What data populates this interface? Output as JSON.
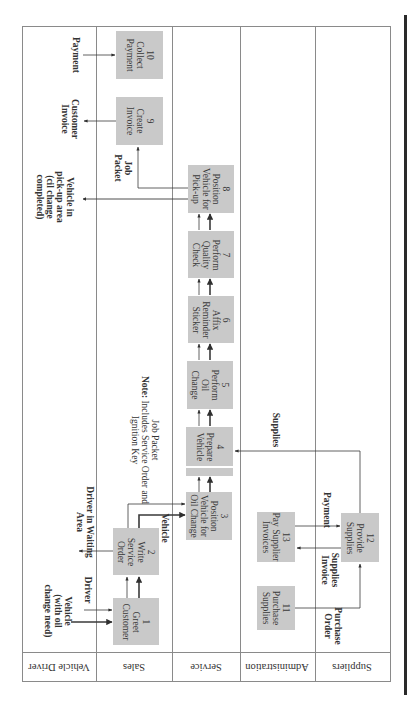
{
  "lanes": [
    {
      "id": "vehicle-driver",
      "label": "Vehicle Driver"
    },
    {
      "id": "sales",
      "label": "Sales"
    },
    {
      "id": "service",
      "label": "Service"
    },
    {
      "id": "administration",
      "label": "Administration"
    },
    {
      "id": "suppliers",
      "label": "Suppliers"
    }
  ],
  "steps": [
    {
      "num": "1",
      "lines": [
        "Greet",
        "Customer"
      ],
      "lane": "sales"
    },
    {
      "num": "2",
      "lines": [
        "Write",
        "Service",
        "Order"
      ],
      "lane": "sales"
    },
    {
      "num": "3",
      "lines": [
        "Position",
        "Vehicle for",
        "Oil Change"
      ],
      "lane": "service"
    },
    {
      "num": "4",
      "lines": [
        "Prepare",
        "Vehicle"
      ],
      "lane": "service"
    },
    {
      "num": "5",
      "lines": [
        "Perform",
        "Oil",
        "Change"
      ],
      "lane": "service"
    },
    {
      "num": "6",
      "lines": [
        "Affix",
        "Reminder",
        "Sticker"
      ],
      "lane": "service"
    },
    {
      "num": "7",
      "lines": [
        "Perform",
        "Quality",
        "Check"
      ],
      "lane": "service"
    },
    {
      "num": "8",
      "lines": [
        "Position",
        "Vehicle for",
        "Pick-up"
      ],
      "lane": "service"
    },
    {
      "num": "9",
      "lines": [
        "Create",
        "Invoice"
      ],
      "lane": "sales"
    },
    {
      "num": "10",
      "lines": [
        "Collect",
        "Payment"
      ],
      "lane": "sales"
    },
    {
      "num": "11",
      "lines": [
        "Purchase",
        "Supplies"
      ],
      "lane": "administration"
    },
    {
      "num": "12",
      "lines": [
        "Provide",
        "Supplies"
      ],
      "lane": "suppliers"
    },
    {
      "num": "13",
      "lines": [
        "Pay Supplier",
        "Invoices"
      ],
      "lane": "administration"
    }
  ],
  "flow_labels": {
    "vehicle_in": [
      "Vehicle",
      "(with oil",
      "change need)"
    ],
    "driver": "Driver",
    "driver_waiting": [
      "Driver in Waiting",
      "Area"
    ],
    "vehicle": "Vehicle",
    "job_packet_note_title": "Job Packet",
    "job_packet_note_prefix": "Note:",
    "job_packet_note_body": "Includes Service Order and",
    "job_packet_note_body2": "Ignition Key",
    "vehicle_pickup": [
      "Vehicle in",
      "pick-up area",
      "(cil change",
      "completed)"
    ],
    "job_packet": [
      "Job",
      "Packet"
    ],
    "customer_invoice": [
      "Customer",
      "Invoice"
    ],
    "payment_in": "Payment",
    "supplies": "Supplies",
    "payment_supplier": "Payment",
    "supplies_invoice": [
      "Supplies",
      "Invoice"
    ],
    "purchase_order": [
      "Purchase",
      "Order"
    ]
  },
  "colors": {
    "box_fill": "#c9c9c9",
    "line": "#8a8a8a",
    "arrow": "#2f2f2f"
  }
}
